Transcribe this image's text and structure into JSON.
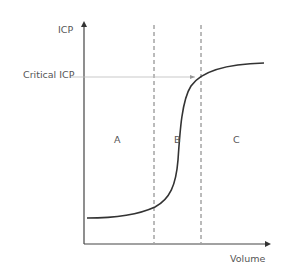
{
  "diagram": {
    "axes": {
      "y_label": "ICP",
      "x_label": "Volume"
    },
    "threshold": {
      "label": "Critical ICP"
    },
    "regions": [
      {
        "id": "A",
        "label": "A"
      },
      {
        "id": "B",
        "label": "B"
      },
      {
        "id": "C",
        "label": "C"
      }
    ],
    "colors": {
      "axis": "#444444",
      "curve": "#333333",
      "dashed": "#777777",
      "threshold_line": "#bbbbbb",
      "text": "#555555"
    }
  }
}
